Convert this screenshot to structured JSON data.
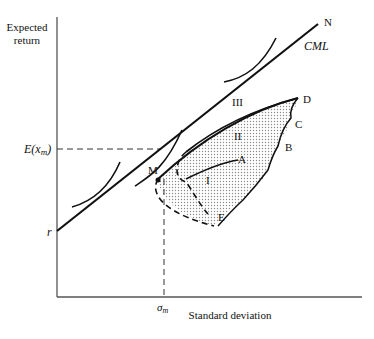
{
  "diagram": {
    "y_axis_label_line1": "Expected",
    "y_axis_label_line2": "return",
    "x_axis_label": "Standard deviation",
    "y_tick_expected_market_return": "E(x",
    "y_tick_expected_market_return_sub": "m",
    "y_tick_expected_market_return_close": ")",
    "y_tick_risk_free": "r",
    "x_tick_sigma": "σ",
    "x_tick_sigma_sub": "m",
    "line_label": "CML",
    "line_end_label": "N",
    "market_point_label": "M",
    "points": {
      "A": "A",
      "B": "B",
      "C": "C",
      "D": "D",
      "E": "E"
    },
    "regions": {
      "I": "I",
      "II": "II",
      "III": "III"
    },
    "colors": {
      "line": "#111111",
      "axis": "#555555",
      "shade": "#9a9a9a"
    }
  }
}
